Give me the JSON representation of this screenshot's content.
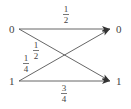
{
  "diagram": {
    "type": "binary channel transition diagram",
    "inputs": [
      {
        "label": "0",
        "x": 12,
        "y": 29
      },
      {
        "label": "1",
        "x": 12,
        "y": 81
      }
    ],
    "outputs": [
      {
        "label": "0",
        "x": 119,
        "y": 29
      },
      {
        "label": "1",
        "x": 119,
        "y": 81
      }
    ],
    "edges": [
      {
        "from": "0",
        "to": "0",
        "probability": {
          "num": "1",
          "den": "2"
        },
        "label_pos": {
          "x": 67,
          "y": 5
        }
      },
      {
        "from": "0",
        "to": "1",
        "probability": {
          "num": "1",
          "den": "2"
        },
        "label_pos": {
          "x": 36,
          "y": 41
        }
      },
      {
        "from": "1",
        "to": "0",
        "probability": {
          "num": "1",
          "den": "4"
        },
        "label_pos": {
          "x": 27,
          "y": 54
        }
      },
      {
        "from": "1",
        "to": "1",
        "probability": {
          "num": "3",
          "den": "4"
        },
        "label_pos": {
          "x": 64,
          "y": 84
        }
      }
    ],
    "colors": {
      "line": "#555555",
      "text": "#444444",
      "background": "#ffffff"
    }
  }
}
